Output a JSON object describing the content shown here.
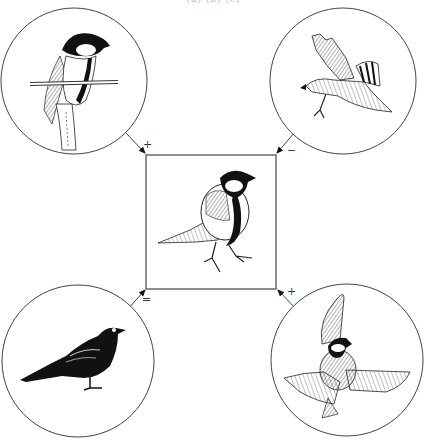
{
  "figure": {
    "caption_fragment": "(a) (b) (c)",
    "center": {
      "label": "great-tit-perched",
      "description": "Great tit (Parus major) perched, central focal species"
    },
    "interactions": [
      {
        "position": "top-left",
        "subject": "great-tit-on-branch",
        "description": "Great tit perched on twig (conspecific / resource)",
        "sign": "+"
      },
      {
        "position": "top-right",
        "subject": "hawk-in-flight",
        "description": "Sparrowhawk in flight with talons out (predator)",
        "sign": "−"
      },
      {
        "position": "bottom-left",
        "subject": "blackbird",
        "description": "Dark blackbird-like bird standing (neutral interaction)",
        "sign": "="
      },
      {
        "position": "bottom-right",
        "subject": "great-tit-flying",
        "description": "Great tit in flight with spread wings",
        "sign": "+"
      }
    ]
  },
  "colors": {
    "ink": "#1a1a1a",
    "line": "#444444",
    "background": "#ffffff"
  }
}
